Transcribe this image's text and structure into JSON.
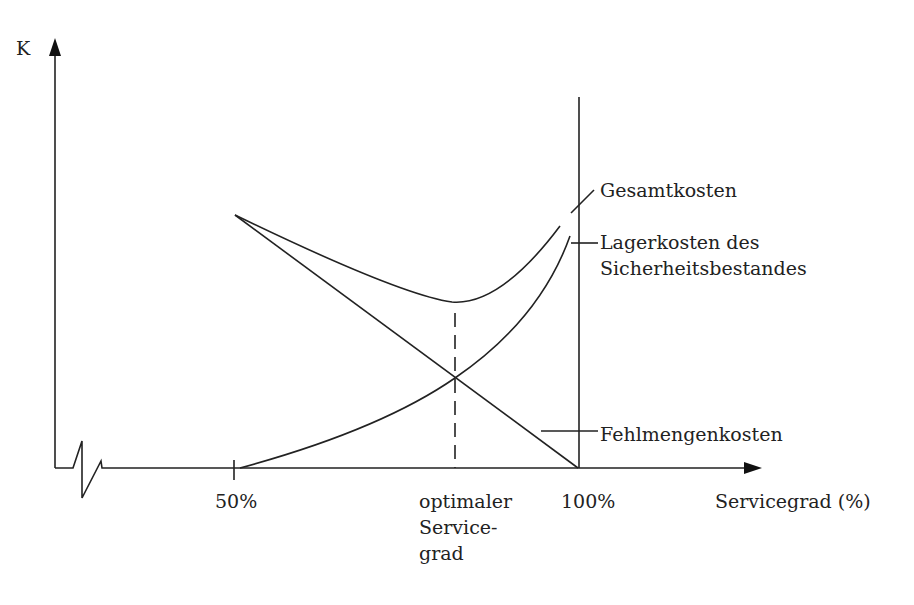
{
  "diagram": {
    "y_axis": {
      "label": "K"
    },
    "x_axis": {
      "label": "Servicegrad (%)",
      "ticks": [
        "50%",
        "100%"
      ],
      "optimum_label": [
        "optimaler",
        "Service-",
        "grad"
      ]
    },
    "curves": [
      {
        "name": "Gesamtkosten",
        "label_lines": [
          "Gesamtkosten"
        ]
      },
      {
        "name": "Lagerkosten des Sicherheitsbestandes",
        "label_lines": [
          "Lagerkosten des",
          "Sicherheitsbestandes"
        ]
      },
      {
        "name": "Fehlmengenkosten",
        "label_lines": [
          "Fehlmengenkosten"
        ]
      }
    ]
  }
}
